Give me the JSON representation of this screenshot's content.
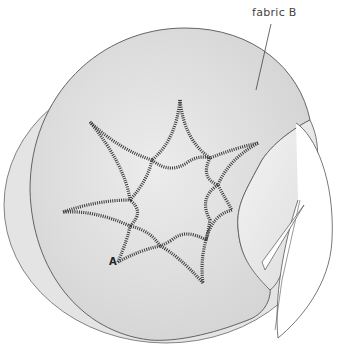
{
  "figure": {
    "type": "sewing-illustration",
    "callout_label": "fabric B",
    "point_label": "A",
    "colors": {
      "fabric_fill": "#d9d9d9",
      "fabric_under": "#e6e6e6",
      "fold_fill": "#ececec",
      "outline": "#555555",
      "stitch": "#3a3a3a",
      "cutout": "#ffffff"
    },
    "star": {
      "points": 7,
      "center": [
        170,
        192
      ],
      "tips": [
        [
          180,
          100
        ],
        [
          258,
          143
        ],
        [
          232,
          210
        ],
        [
          203,
          283
        ],
        [
          118,
          262
        ],
        [
          63,
          212
        ],
        [
          90,
          122
        ]
      ]
    }
  }
}
